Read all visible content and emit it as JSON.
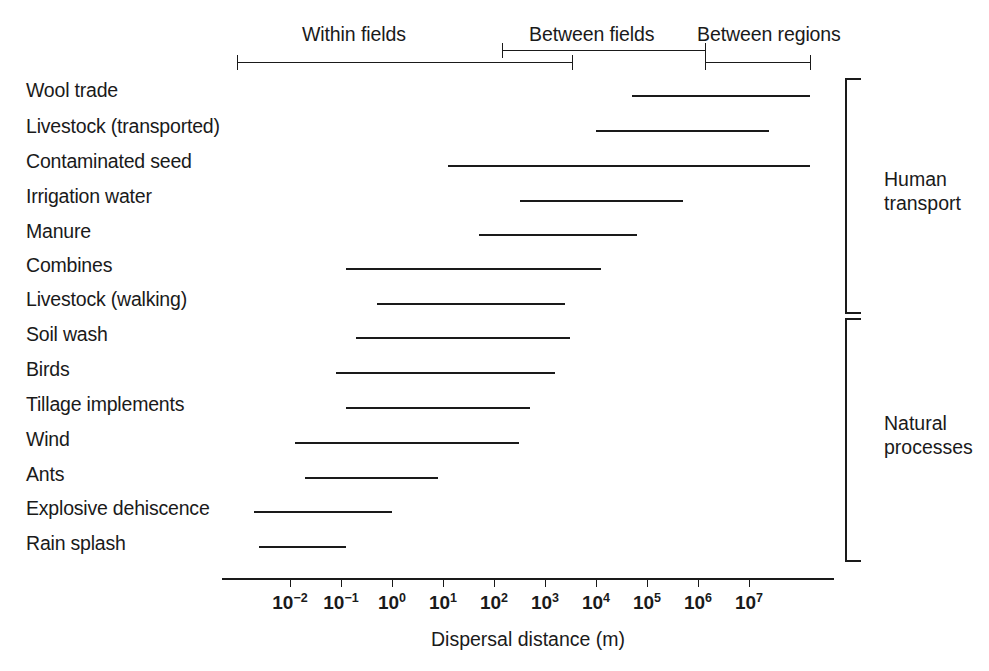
{
  "chart_data": {
    "type": "bar",
    "orientation": "horizontal-range",
    "title": "",
    "xlabel": "Dispersal distance (m)",
    "ylabel": "",
    "xscale": "log10",
    "xlim": [
      -2.8,
      8.3
    ],
    "grid": false,
    "legend": "none",
    "tick_labels": [
      "10⁻²",
      "10⁻¹",
      "10⁰",
      "10¹",
      "10²",
      "10³",
      "10⁴",
      "10⁵",
      "10⁶",
      "10⁷"
    ],
    "tick_mantissas": [
      "10",
      "10",
      "10",
      "10",
      "10",
      "10",
      "10",
      "10",
      "10",
      "10"
    ],
    "tick_exponents": [
      "-2",
      "-1",
      "0",
      "1",
      "2",
      "3",
      "4",
      "5",
      "6",
      "7"
    ],
    "tick_exponent_values": [
      -2,
      -1,
      0,
      1,
      2,
      3,
      4,
      5,
      6,
      7
    ],
    "categories": [
      "Wool trade",
      "Livestock (transported)",
      "Contaminated seed",
      "Irrigation water",
      "Manure",
      "Combines",
      "Livestock (walking)",
      "Soil wash",
      "Birds",
      "Tillage implements",
      "Wind",
      "Ants",
      "Explosive dehiscence",
      "Rain splash"
    ],
    "ranges_log10": [
      [
        4.7,
        8.2
      ],
      [
        4.0,
        7.4
      ],
      [
        1.1,
        8.2
      ],
      [
        2.5,
        5.7
      ],
      [
        1.7,
        4.8
      ],
      [
        -0.9,
        4.1
      ],
      [
        -0.3,
        3.4
      ],
      [
        -0.7,
        3.5
      ],
      [
        -1.1,
        3.2
      ],
      [
        -0.9,
        2.7
      ],
      [
        -1.9,
        2.5
      ],
      [
        -1.7,
        0.9
      ],
      [
        -2.7,
        0.0
      ],
      [
        -2.6,
        -0.9
      ]
    ],
    "annotations": {
      "scale_segments": [
        {
          "label": "Within fields",
          "start_log10": -2.95,
          "end_log10": 3.5,
          "row": 1
        },
        {
          "label": "Between fields",
          "start_log10": 2.2,
          "end_log10": 6.1,
          "row": 0
        },
        {
          "label": "Between regions",
          "start_log10": 6.1,
          "end_log10": 8.2,
          "row": 1
        }
      ],
      "groups": [
        {
          "label": "Human\ntransport",
          "from_category": "Wool trade",
          "to_category": "Livestock (walking)"
        },
        {
          "label": "Natural\nprocesses",
          "from_category": "Soil wash",
          "to_category": "Rain splash"
        }
      ]
    }
  },
  "colors": {
    "ink": "#1a1a1a",
    "background": "#ffffff"
  }
}
